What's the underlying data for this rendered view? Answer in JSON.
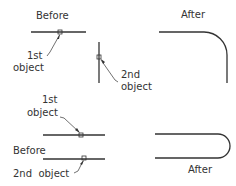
{
  "colors": {
    "line": "#333333",
    "text": "#333333",
    "background": "#ffffff"
  },
  "top": {
    "before_label": "Before",
    "after_label": "After",
    "first_object": {
      "line1": "1st",
      "line2": "object"
    },
    "second_object": {
      "line1": "2nd",
      "line2": "object"
    }
  },
  "bottom": {
    "before_label": "Before",
    "after_label": "After",
    "first_object": {
      "line1": "1st",
      "line2": "object"
    },
    "second_object": {
      "line1": "2nd  object"
    }
  }
}
